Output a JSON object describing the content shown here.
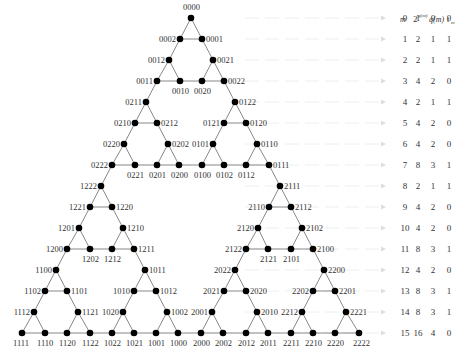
{
  "diagram": {
    "node_color": "#000000",
    "edge_color": "#888888",
    "guide_color": "#eeeeee",
    "nodes": [
      {
        "label": "0000",
        "x": 191,
        "y": 18,
        "lx": 183,
        "ly": 10,
        "anchor": "start"
      },
      {
        "label": "0002",
        "x": 180,
        "y": 39,
        "lx": 176,
        "ly": 42,
        "anchor": "end"
      },
      {
        "label": "0001",
        "x": 202,
        "y": 39,
        "lx": 206,
        "ly": 42,
        "anchor": "start"
      },
      {
        "label": "0012",
        "x": 169,
        "y": 60,
        "lx": 165,
        "ly": 63,
        "anchor": "end"
      },
      {
        "label": "0021",
        "x": 213,
        "y": 60,
        "lx": 217,
        "ly": 63,
        "anchor": "start"
      },
      {
        "label": "0011",
        "x": 157,
        "y": 81,
        "lx": 153,
        "ly": 84,
        "anchor": "end"
      },
      {
        "label": "0010",
        "x": 180,
        "y": 81,
        "lx": 172,
        "ly": 94,
        "anchor": "start"
      },
      {
        "label": "0020",
        "x": 202,
        "y": 81,
        "lx": 194,
        "ly": 94,
        "anchor": "start"
      },
      {
        "label": "0022",
        "x": 224,
        "y": 81,
        "lx": 228,
        "ly": 84,
        "anchor": "start"
      },
      {
        "label": "0211",
        "x": 146,
        "y": 102,
        "lx": 142,
        "ly": 105,
        "anchor": "end"
      },
      {
        "label": "0122",
        "x": 235,
        "y": 102,
        "lx": 239,
        "ly": 105,
        "anchor": "start"
      },
      {
        "label": "0210",
        "x": 135,
        "y": 123,
        "lx": 131,
        "ly": 126,
        "anchor": "end"
      },
      {
        "label": "0212",
        "x": 157,
        "y": 123,
        "lx": 161,
        "ly": 126,
        "anchor": "start"
      },
      {
        "label": "0121",
        "x": 224,
        "y": 123,
        "lx": 220,
        "ly": 126,
        "anchor": "end"
      },
      {
        "label": "0120",
        "x": 246,
        "y": 123,
        "lx": 250,
        "ly": 126,
        "anchor": "start"
      },
      {
        "label": "0220",
        "x": 124,
        "y": 144,
        "lx": 120,
        "ly": 147,
        "anchor": "end"
      },
      {
        "label": "0202",
        "x": 168,
        "y": 144,
        "lx": 172,
        "ly": 147,
        "anchor": "start"
      },
      {
        "label": "0101",
        "x": 213,
        "y": 144,
        "lx": 209,
        "ly": 147,
        "anchor": "end"
      },
      {
        "label": "0110",
        "x": 257,
        "y": 144,
        "lx": 261,
        "ly": 147,
        "anchor": "start"
      },
      {
        "label": "0222",
        "x": 112,
        "y": 165,
        "lx": 108,
        "ly": 168,
        "anchor": "end"
      },
      {
        "label": "0221",
        "x": 135,
        "y": 165,
        "lx": 127,
        "ly": 178,
        "anchor": "start"
      },
      {
        "label": "0201",
        "x": 157,
        "y": 165,
        "lx": 149,
        "ly": 178,
        "anchor": "start"
      },
      {
        "label": "0200",
        "x": 179,
        "y": 165,
        "lx": 171,
        "ly": 178,
        "anchor": "start"
      },
      {
        "label": "0100",
        "x": 202,
        "y": 165,
        "lx": 194,
        "ly": 178,
        "anchor": "start"
      },
      {
        "label": "0102",
        "x": 224,
        "y": 165,
        "lx": 216,
        "ly": 178,
        "anchor": "start"
      },
      {
        "label": "0112",
        "x": 246,
        "y": 165,
        "lx": 238,
        "ly": 178,
        "anchor": "start"
      },
      {
        "label": "0111",
        "x": 269,
        "y": 165,
        "lx": 273,
        "ly": 168,
        "anchor": "start"
      },
      {
        "label": "1222",
        "x": 101,
        "y": 186,
        "lx": 97,
        "ly": 189,
        "anchor": "end"
      },
      {
        "label": "2111",
        "x": 280,
        "y": 186,
        "lx": 284,
        "ly": 189,
        "anchor": "start"
      },
      {
        "label": "1221",
        "x": 90,
        "y": 207,
        "lx": 86,
        "ly": 210,
        "anchor": "end"
      },
      {
        "label": "1220",
        "x": 112,
        "y": 207,
        "lx": 116,
        "ly": 210,
        "anchor": "start"
      },
      {
        "label": "2110",
        "x": 269,
        "y": 207,
        "lx": 265,
        "ly": 210,
        "anchor": "end"
      },
      {
        "label": "2112",
        "x": 291,
        "y": 207,
        "lx": 295,
        "ly": 210,
        "anchor": "start"
      },
      {
        "label": "1201",
        "x": 79,
        "y": 228,
        "lx": 75,
        "ly": 231,
        "anchor": "end"
      },
      {
        "label": "1210",
        "x": 123,
        "y": 228,
        "lx": 127,
        "ly": 231,
        "anchor": "start"
      },
      {
        "label": "2120",
        "x": 258,
        "y": 228,
        "lx": 254,
        "ly": 231,
        "anchor": "end"
      },
      {
        "label": "2102",
        "x": 302,
        "y": 228,
        "lx": 306,
        "ly": 231,
        "anchor": "start"
      },
      {
        "label": "1200",
        "x": 67,
        "y": 249,
        "lx": 63,
        "ly": 252,
        "anchor": "end"
      },
      {
        "label": "1202",
        "x": 90,
        "y": 249,
        "lx": 82,
        "ly": 262,
        "anchor": "start"
      },
      {
        "label": "1212",
        "x": 112,
        "y": 249,
        "lx": 104,
        "ly": 262,
        "anchor": "start"
      },
      {
        "label": "1211",
        "x": 134,
        "y": 249,
        "lx": 138,
        "ly": 252,
        "anchor": "start"
      },
      {
        "label": "2122",
        "x": 246,
        "y": 249,
        "lx": 242,
        "ly": 252,
        "anchor": "end"
      },
      {
        "label": "2121",
        "x": 268,
        "y": 249,
        "lx": 260,
        "ly": 262,
        "anchor": "start"
      },
      {
        "label": "2101",
        "x": 291,
        "y": 249,
        "lx": 283,
        "ly": 262,
        "anchor": "start"
      },
      {
        "label": "2100",
        "x": 313,
        "y": 249,
        "lx": 317,
        "ly": 252,
        "anchor": "start"
      },
      {
        "label": "1100",
        "x": 56,
        "y": 270,
        "lx": 52,
        "ly": 273,
        "anchor": "end"
      },
      {
        "label": "1011",
        "x": 145,
        "y": 270,
        "lx": 149,
        "ly": 273,
        "anchor": "start"
      },
      {
        "label": "2022",
        "x": 235,
        "y": 270,
        "lx": 231,
        "ly": 273,
        "anchor": "end"
      },
      {
        "label": "2200",
        "x": 324,
        "y": 270,
        "lx": 328,
        "ly": 273,
        "anchor": "start"
      },
      {
        "label": "1102",
        "x": 45,
        "y": 291,
        "lx": 41,
        "ly": 294,
        "anchor": "end"
      },
      {
        "label": "1101",
        "x": 67,
        "y": 291,
        "lx": 71,
        "ly": 294,
        "anchor": "start"
      },
      {
        "label": "1010",
        "x": 134,
        "y": 291,
        "lx": 130,
        "ly": 294,
        "anchor": "end"
      },
      {
        "label": "1012",
        "x": 156,
        "y": 291,
        "lx": 160,
        "ly": 294,
        "anchor": "start"
      },
      {
        "label": "2021",
        "x": 224,
        "y": 291,
        "lx": 220,
        "ly": 294,
        "anchor": "end"
      },
      {
        "label": "2020",
        "x": 246,
        "y": 291,
        "lx": 250,
        "ly": 294,
        "anchor": "start"
      },
      {
        "label": "2202",
        "x": 313,
        "y": 291,
        "lx": 309,
        "ly": 294,
        "anchor": "end"
      },
      {
        "label": "2201",
        "x": 335,
        "y": 291,
        "lx": 339,
        "ly": 294,
        "anchor": "start"
      },
      {
        "label": "1112",
        "x": 34,
        "y": 312,
        "lx": 30,
        "ly": 315,
        "anchor": "end"
      },
      {
        "label": "1121",
        "x": 78,
        "y": 312,
        "lx": 82,
        "ly": 315,
        "anchor": "start"
      },
      {
        "label": "1020",
        "x": 123,
        "y": 312,
        "lx": 119,
        "ly": 315,
        "anchor": "end"
      },
      {
        "label": "1002",
        "x": 167,
        "y": 312,
        "lx": 171,
        "ly": 315,
        "anchor": "start"
      },
      {
        "label": "2001",
        "x": 212,
        "y": 312,
        "lx": 208,
        "ly": 315,
        "anchor": "end"
      },
      {
        "label": "2010",
        "x": 257,
        "y": 312,
        "lx": 261,
        "ly": 315,
        "anchor": "start"
      },
      {
        "label": "2212",
        "x": 302,
        "y": 312,
        "lx": 298,
        "ly": 315,
        "anchor": "end"
      },
      {
        "label": "2221",
        "x": 346,
        "y": 312,
        "lx": 350,
        "ly": 315,
        "anchor": "start"
      },
      {
        "label": "1111",
        "x": 22,
        "y": 333,
        "lx": 13,
        "ly": 346,
        "anchor": "start"
      },
      {
        "label": "1110",
        "x": 45,
        "y": 333,
        "lx": 37,
        "ly": 346,
        "anchor": "start"
      },
      {
        "label": "1120",
        "x": 67,
        "y": 333,
        "lx": 59,
        "ly": 346,
        "anchor": "start"
      },
      {
        "label": "1122",
        "x": 90,
        "y": 333,
        "lx": 82,
        "ly": 346,
        "anchor": "start"
      },
      {
        "label": "1022",
        "x": 112,
        "y": 333,
        "lx": 104,
        "ly": 346,
        "anchor": "start"
      },
      {
        "label": "1021",
        "x": 134,
        "y": 333,
        "lx": 126,
        "ly": 346,
        "anchor": "start"
      },
      {
        "label": "1001",
        "x": 156,
        "y": 333,
        "lx": 148,
        "ly": 346,
        "anchor": "start"
      },
      {
        "label": "1000",
        "x": 178,
        "y": 333,
        "lx": 170,
        "ly": 346,
        "anchor": "start"
      },
      {
        "label": "2000",
        "x": 201,
        "y": 333,
        "lx": 193,
        "ly": 346,
        "anchor": "start"
      },
      {
        "label": "2002",
        "x": 223,
        "y": 333,
        "lx": 215,
        "ly": 346,
        "anchor": "start"
      },
      {
        "label": "2012",
        "x": 246,
        "y": 333,
        "lx": 238,
        "ly": 346,
        "anchor": "start"
      },
      {
        "label": "2011",
        "x": 268,
        "y": 333,
        "lx": 260,
        "ly": 346,
        "anchor": "start"
      },
      {
        "label": "2211",
        "x": 291,
        "y": 333,
        "lx": 283,
        "ly": 346,
        "anchor": "start"
      },
      {
        "label": "2210",
        "x": 313,
        "y": 333,
        "lx": 305,
        "ly": 346,
        "anchor": "start"
      },
      {
        "label": "2220",
        "x": 335,
        "y": 333,
        "lx": 327,
        "ly": 346,
        "anchor": "start"
      },
      {
        "label": "2222",
        "x": 359,
        "y": 333,
        "lx": 353,
        "ly": 346,
        "anchor": "start"
      }
    ],
    "edges": [
      [
        "0000",
        "0002"
      ],
      [
        "0000",
        "0001"
      ],
      [
        "0002",
        "0001"
      ],
      [
        "0002",
        "0012"
      ],
      [
        "0001",
        "0021"
      ],
      [
        "0012",
        "0011"
      ],
      [
        "0012",
        "0010"
      ],
      [
        "0011",
        "0010"
      ],
      [
        "0021",
        "0020"
      ],
      [
        "0021",
        "0022"
      ],
      [
        "0020",
        "0022"
      ],
      [
        "0010",
        "0020"
      ],
      [
        "0011",
        "0211"
      ],
      [
        "0022",
        "0122"
      ],
      [
        "0211",
        "0210"
      ],
      [
        "0211",
        "0212"
      ],
      [
        "0210",
        "0212"
      ],
      [
        "0210",
        "0220"
      ],
      [
        "0212",
        "0202"
      ],
      [
        "0220",
        "0222"
      ],
      [
        "0220",
        "0221"
      ],
      [
        "0222",
        "0221"
      ],
      [
        "0202",
        "0201"
      ],
      [
        "0202",
        "0200"
      ],
      [
        "0201",
        "0200"
      ],
      [
        "0221",
        "0201"
      ],
      [
        "0122",
        "0121"
      ],
      [
        "0122",
        "0120"
      ],
      [
        "0121",
        "0120"
      ],
      [
        "0121",
        "0101"
      ],
      [
        "0120",
        "0110"
      ],
      [
        "0101",
        "0100"
      ],
      [
        "0101",
        "0102"
      ],
      [
        "0100",
        "0102"
      ],
      [
        "0110",
        "0112"
      ],
      [
        "0110",
        "0111"
      ],
      [
        "0112",
        "0111"
      ],
      [
        "0102",
        "0112"
      ],
      [
        "0200",
        "0100"
      ],
      [
        "0222",
        "1222"
      ],
      [
        "0111",
        "2111"
      ],
      [
        "1222",
        "1221"
      ],
      [
        "1222",
        "1220"
      ],
      [
        "1221",
        "1220"
      ],
      [
        "1221",
        "1201"
      ],
      [
        "1220",
        "1210"
      ],
      [
        "1201",
        "1200"
      ],
      [
        "1201",
        "1202"
      ],
      [
        "1200",
        "1202"
      ],
      [
        "1210",
        "1212"
      ],
      [
        "1210",
        "1211"
      ],
      [
        "1212",
        "1211"
      ],
      [
        "1202",
        "1212"
      ],
      [
        "1200",
        "1100"
      ],
      [
        "1211",
        "1011"
      ],
      [
        "1100",
        "1102"
      ],
      [
        "1100",
        "1101"
      ],
      [
        "1102",
        "1101"
      ],
      [
        "1102",
        "1112"
      ],
      [
        "1101",
        "1121"
      ],
      [
        "1112",
        "1111"
      ],
      [
        "1112",
        "1110"
      ],
      [
        "1111",
        "1110"
      ],
      [
        "1121",
        "1120"
      ],
      [
        "1121",
        "1122"
      ],
      [
        "1120",
        "1122"
      ],
      [
        "1110",
        "1120"
      ],
      [
        "1011",
        "1010"
      ],
      [
        "1011",
        "1012"
      ],
      [
        "1010",
        "1012"
      ],
      [
        "1010",
        "1020"
      ],
      [
        "1012",
        "1002"
      ],
      [
        "1020",
        "1022"
      ],
      [
        "1020",
        "1021"
      ],
      [
        "1022",
        "1021"
      ],
      [
        "1002",
        "1001"
      ],
      [
        "1002",
        "1000"
      ],
      [
        "1001",
        "1000"
      ],
      [
        "1021",
        "1001"
      ],
      [
        "1122",
        "1022"
      ],
      [
        "2111",
        "2110"
      ],
      [
        "2111",
        "2112"
      ],
      [
        "2110",
        "2112"
      ],
      [
        "2110",
        "2120"
      ],
      [
        "2112",
        "2102"
      ],
      [
        "2120",
        "2122"
      ],
      [
        "2120",
        "2121"
      ],
      [
        "2122",
        "2121"
      ],
      [
        "2102",
        "2101"
      ],
      [
        "2102",
        "2100"
      ],
      [
        "2101",
        "2100"
      ],
      [
        "2121",
        "2101"
      ],
      [
        "2122",
        "2022"
      ],
      [
        "2100",
        "2200"
      ],
      [
        "2022",
        "2021"
      ],
      [
        "2022",
        "2020"
      ],
      [
        "2021",
        "2020"
      ],
      [
        "2021",
        "2001"
      ],
      [
        "2020",
        "2010"
      ],
      [
        "2001",
        "2000"
      ],
      [
        "2001",
        "2002"
      ],
      [
        "2000",
        "2002"
      ],
      [
        "2010",
        "2012"
      ],
      [
        "2010",
        "2011"
      ],
      [
        "2012",
        "2011"
      ],
      [
        "2002",
        "2012"
      ],
      [
        "2200",
        "2202"
      ],
      [
        "2200",
        "2201"
      ],
      [
        "2202",
        "2201"
      ],
      [
        "2202",
        "2212"
      ],
      [
        "2201",
        "2221"
      ],
      [
        "2212",
        "2211"
      ],
      [
        "2212",
        "2210"
      ],
      [
        "2211",
        "2210"
      ],
      [
        "2221",
        "2220"
      ],
      [
        "2221",
        "2222"
      ],
      [
        "2220",
        "2222"
      ],
      [
        "2210",
        "2220"
      ],
      [
        "2011",
        "2211"
      ],
      [
        "1000",
        "2000"
      ]
    ]
  },
  "table": {
    "headers": [
      "m",
      "2^{q(m)}",
      "q(m)",
      "t_m"
    ],
    "header_parts": {
      "m": "m",
      "pow_base": "2",
      "pow_exp": "q(m)",
      "q": "q(m)",
      "t_base": "t",
      "t_sub": "m"
    },
    "rows": [
      {
        "m": "0",
        "pow": "1",
        "q": "0",
        "t": "0",
        "y": 18
      },
      {
        "m": "1",
        "pow": "2",
        "q": "1",
        "t": "1",
        "y": 39
      },
      {
        "m": "2",
        "pow": "2",
        "q": "1",
        "t": "1",
        "y": 60
      },
      {
        "m": "3",
        "pow": "4",
        "q": "2",
        "t": "0",
        "y": 81
      },
      {
        "m": "4",
        "pow": "2",
        "q": "1",
        "t": "1",
        "y": 102
      },
      {
        "m": "5",
        "pow": "4",
        "q": "2",
        "t": "0",
        "y": 123
      },
      {
        "m": "6",
        "pow": "4",
        "q": "2",
        "t": "0",
        "y": 144
      },
      {
        "m": "7",
        "pow": "8",
        "q": "3",
        "t": "1",
        "y": 165
      },
      {
        "m": "8",
        "pow": "2",
        "q": "1",
        "t": "1",
        "y": 186
      },
      {
        "m": "9",
        "pow": "4",
        "q": "2",
        "t": "0",
        "y": 207
      },
      {
        "m": "10",
        "pow": "4",
        "q": "2",
        "t": "0",
        "y": 228
      },
      {
        "m": "11",
        "pow": "8",
        "q": "3",
        "t": "1",
        "y": 249
      },
      {
        "m": "12",
        "pow": "4",
        "q": "2",
        "t": "0",
        "y": 270
      },
      {
        "m": "13",
        "pow": "8",
        "q": "3",
        "t": "1",
        "y": 291
      },
      {
        "m": "14",
        "pow": "8",
        "q": "3",
        "t": "1",
        "y": 312
      },
      {
        "m": "15",
        "pow": "16",
        "q": "4",
        "t": "0",
        "y": 333
      }
    ],
    "arrow_icon": "arrow-right-icon"
  }
}
